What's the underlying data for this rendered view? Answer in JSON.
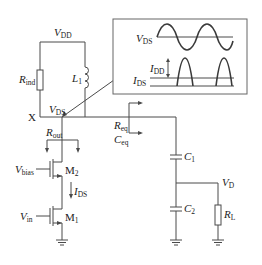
{
  "diagram": {
    "labels": {
      "vdd": {
        "main": "V",
        "sub": "DD"
      },
      "rind": {
        "main": "R",
        "sub": "ind"
      },
      "l1": {
        "main": "L",
        "sub": "1"
      },
      "node_x": "X",
      "vds": {
        "main": "V",
        "sub": "DS"
      },
      "rout": {
        "main": "R",
        "sub": "out"
      },
      "req": {
        "main": "R",
        "sub": "eq"
      },
      "ceq": {
        "main": "C",
        "sub": "eq"
      },
      "c1": {
        "main": "C",
        "sub": "1"
      },
      "c2": {
        "main": "C",
        "sub": "2"
      },
      "vd": {
        "main": "V",
        "sub": "D"
      },
      "rl": {
        "main": "R",
        "sub": "L"
      },
      "vbias": {
        "main": "V",
        "sub": "bias"
      },
      "m2": {
        "main": "M",
        "sub": "2"
      },
      "ids": {
        "main": "I",
        "sub": "DS"
      },
      "vin": {
        "main": "V",
        "sub": "in"
      },
      "m1": {
        "main": "M",
        "sub": "1"
      }
    },
    "inset": {
      "vds": {
        "main": "V",
        "sub": "DS"
      },
      "idd": {
        "main": "I",
        "sub": "DD"
      },
      "ids": {
        "main": "I",
        "sub": "DS"
      },
      "waveforms": [
        "sinusoidal V_DS",
        "half-sine current pulses I_DS above I_DD level"
      ]
    },
    "colors": {
      "wire": "#4a4a4a",
      "text": "#222222",
      "background": "#ffffff"
    }
  }
}
